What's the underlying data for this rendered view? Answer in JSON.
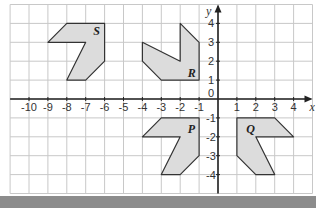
{
  "diagram": {
    "axes": {
      "x_label": "x",
      "y_label": "y",
      "x_ticks": [
        -10,
        -9,
        -8,
        -7,
        -6,
        -5,
        -4,
        -3,
        -2,
        -1,
        1,
        2,
        3,
        4
      ],
      "y_ticks": [
        4,
        3,
        2,
        1,
        -1,
        -2,
        -3,
        -4
      ],
      "origin_label": "0",
      "x_range": [
        -11,
        5
      ],
      "y_range": [
        -5,
        5
      ]
    },
    "colors": {
      "grid": "#c8c8c8",
      "axis": "#222222",
      "shape_fill": "#dcdcdc",
      "shape_stroke": "#333333",
      "bottom_bar": "#8c8c8c"
    },
    "shapes": [
      {
        "label": "S",
        "label_pos": [
          -6.6,
          3.6
        ],
        "points": [
          [
            -8,
            4
          ],
          [
            -6,
            4
          ],
          [
            -6,
            2
          ],
          [
            -7,
            1
          ],
          [
            -8,
            1
          ],
          [
            -7,
            3
          ],
          [
            -9,
            3
          ]
        ]
      },
      {
        "label": "R",
        "label_pos": [
          -1.6,
          1.4
        ],
        "points": [
          [
            -2,
            4
          ],
          [
            -1,
            3
          ],
          [
            -1,
            1
          ],
          [
            -3,
            1
          ],
          [
            -4,
            2
          ],
          [
            -4,
            3
          ],
          [
            -2,
            2
          ]
        ]
      },
      {
        "label": "P",
        "label_pos": [
          -1.6,
          -1.6
        ],
        "points": [
          [
            -3,
            -1
          ],
          [
            -1,
            -1
          ],
          [
            -1,
            -3
          ],
          [
            -2,
            -4
          ],
          [
            -3,
            -4
          ],
          [
            -2,
            -2
          ],
          [
            -4,
            -2
          ]
        ]
      },
      {
        "label": "Q",
        "label_pos": [
          1.5,
          -1.6
        ],
        "points": [
          [
            1,
            -1
          ],
          [
            3,
            -1
          ],
          [
            4,
            -2
          ],
          [
            2,
            -2
          ],
          [
            3,
            -4
          ],
          [
            2,
            -4
          ],
          [
            1,
            -3
          ]
        ]
      }
    ]
  }
}
